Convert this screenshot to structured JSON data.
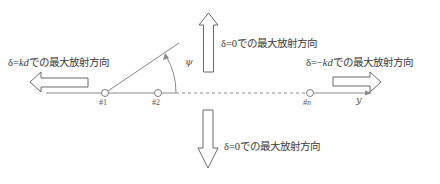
{
  "diagram": {
    "labels": {
      "left_arrow": {
        "prefix": "δ=",
        "var": "kd",
        "suffix": "での最大放射方向"
      },
      "top_arrow": {
        "text": "δ=0での最大放射方向"
      },
      "bottom_arrow": {
        "text": "δ=0での最大放射方向"
      },
      "right_arrow": {
        "prefix": "δ=−",
        "var": "kd",
        "suffix": "での最大放射方向"
      }
    },
    "elements": [
      {
        "id": "el-1",
        "label": "#1"
      },
      {
        "id": "el-2",
        "label": "#2"
      },
      {
        "id": "el-n",
        "label": "#n"
      }
    ],
    "axis_label": "y",
    "angle_label": "ψ",
    "colors": {
      "line": "#8a8a8a",
      "arrow_stroke": "#6a6a6a",
      "text": "#3a3a3a"
    }
  }
}
